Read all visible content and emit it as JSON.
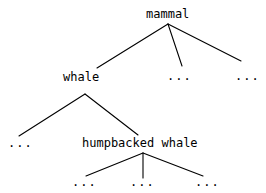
{
  "diagram": {
    "type": "taxonomy-tree",
    "background_color": "#ffffff",
    "stroke_color": "#000000",
    "text_color": "#000000",
    "nodes": {
      "root": "mammal",
      "level2_left": "whale",
      "level2_middle": "...",
      "level2_right": "...",
      "level3_left": "...",
      "level3_right": "humpbacked whale",
      "level4_left": "...",
      "level4_middle": "...",
      "level4_right": "..."
    },
    "edges": [
      {
        "from": "mammal",
        "to": "whale"
      },
      {
        "from": "mammal",
        "to": "level2_middle"
      },
      {
        "from": "mammal",
        "to": "level2_right"
      },
      {
        "from": "whale",
        "to": "level3_left"
      },
      {
        "from": "whale",
        "to": "humpbacked whale"
      },
      {
        "from": "humpbacked whale",
        "to": "level4_left"
      },
      {
        "from": "humpbacked whale",
        "to": "level4_middle"
      },
      {
        "from": "humpbacked whale",
        "to": "level4_right"
      }
    ]
  }
}
